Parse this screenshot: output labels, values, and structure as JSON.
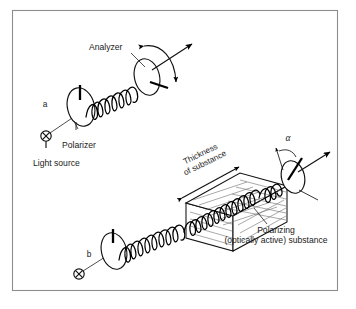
{
  "figure": {
    "border_color": "#8d8d8d",
    "background_color": "#ffffff",
    "ink_color": "#111111",
    "hatch_color": "#6e6e6e"
  },
  "panels": [
    {
      "id": "a",
      "label": "a",
      "description": "Plane polarized light passes unchanged from polarizer to analyzer",
      "labels": {
        "analyzer": "Analyzer",
        "polarizer": "Polarizer",
        "light_source": "Light source"
      },
      "icons": {
        "light_source": "circled-x-icon",
        "rotation_arc": "double-arrow-arc-icon"
      }
    },
    {
      "id": "b",
      "label": "b",
      "description": "Plane of polarization is rotated by angle alpha after passing through the substance",
      "labels": {
        "thickness_line1": "Thickness",
        "thickness_line2": "of substance",
        "substance_line1": "Polarizing",
        "substance_line2": "(optically active) substance",
        "angle": "α"
      },
      "icons": {
        "light_source": "circled-x-icon",
        "thickness_dimension": "double-headed-arrow-icon",
        "angle_arc": "angle-arc-icon"
      }
    }
  ]
}
